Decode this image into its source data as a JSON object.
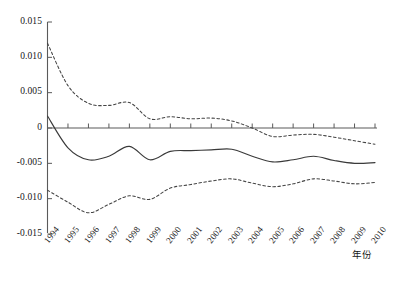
{
  "chart_data": {
    "type": "line",
    "title": "",
    "subtitle": "",
    "xlabel": "年份",
    "ylabel": "",
    "grid": false,
    "legend": "none",
    "xlim": [
      1994,
      2010
    ],
    "ylim": [
      -0.015,
      0.015
    ],
    "x": [
      1994,
      1995,
      1996,
      1997,
      1998,
      1999,
      2000,
      2001,
      2002,
      2003,
      2004,
      2005,
      2006,
      2007,
      2008,
      2009,
      2010
    ],
    "xtick_labels": [
      "1994",
      "1995",
      "1996",
      "1997",
      "1998",
      "1999",
      "2000",
      "2001",
      "2002",
      "2003",
      "2004",
      "2005",
      "2006",
      "2007",
      "2008",
      "2009",
      "2010"
    ],
    "ytick_values": [
      0.015,
      0.01,
      0.005,
      0,
      -0.005,
      -0.01,
      -0.015
    ],
    "ytick_labels": [
      "0.015",
      "0.010",
      "0.005",
      "0",
      "-0.005",
      "-0.010",
      "-0.015"
    ],
    "series": [
      {
        "name": "upper-confidence-band",
        "style": "dashed",
        "color": "#444444",
        "values": [
          0.012,
          0.006,
          0.0035,
          0.0032,
          0.0036,
          0.0013,
          0.0016,
          0.0013,
          0.0014,
          0.001,
          0.0,
          -0.0012,
          -0.001,
          -0.0009,
          -0.0013,
          -0.0018,
          -0.0023
        ]
      },
      {
        "name": "estimate",
        "style": "solid",
        "color": "#3a3a3a",
        "values": [
          0.0017,
          -0.0028,
          -0.0045,
          -0.004,
          -0.0026,
          -0.0045,
          -0.0033,
          -0.0032,
          -0.0031,
          -0.003,
          -0.004,
          -0.0048,
          -0.0045,
          -0.004,
          -0.0046,
          -0.005,
          -0.0049
        ]
      },
      {
        "name": "lower-confidence-band",
        "style": "dashed",
        "color": "#444444",
        "values": [
          -0.0088,
          -0.0105,
          -0.012,
          -0.0108,
          -0.0096,
          -0.0101,
          -0.0085,
          -0.008,
          -0.0075,
          -0.0072,
          -0.0078,
          -0.0083,
          -0.0079,
          -0.0072,
          -0.0075,
          -0.0079,
          -0.0077
        ]
      }
    ]
  },
  "axes": {
    "zero_line_label": "0",
    "x_axis_title": "年份"
  }
}
